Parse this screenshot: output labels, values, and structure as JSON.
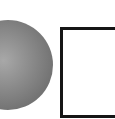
{
  "diagram": {
    "shapes": [
      {
        "type": "sphere",
        "fill": "#8a8a8a",
        "shading": "radial-gradient"
      },
      {
        "type": "square",
        "stroke": "#151515",
        "fill": "#ffffff"
      }
    ]
  }
}
